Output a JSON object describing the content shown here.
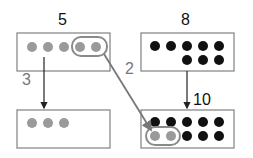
{
  "diagram": {
    "boxes": [
      {
        "id": "top-left",
        "label": "5",
        "gray_dots": 5,
        "black_dots": 0
      },
      {
        "id": "top-right",
        "label": "8",
        "gray_dots": 0,
        "black_dots": 8
      },
      {
        "id": "bottom-left",
        "label": "",
        "gray_dots": 3,
        "black_dots": 0
      },
      {
        "id": "bottom-right",
        "label": "10",
        "gray_dots": 2,
        "black_dots": 8
      }
    ],
    "arrows": [
      {
        "from": "top-left",
        "to": "bottom-left",
        "label": "3"
      },
      {
        "from": "top-left",
        "to": "bottom-right",
        "label": "2"
      },
      {
        "from": "top-right",
        "to": "bottom-right",
        "label": ""
      }
    ],
    "labels": {
      "top_left": "5",
      "top_right": "8",
      "bottom_right": "10",
      "arrow_left": "3",
      "arrow_diag": "2"
    },
    "colors": {
      "gray_dot": "#9a9a9a",
      "black_dot": "#111111",
      "box_border": "#8a8a8a",
      "highlight": "#8a8a8a"
    }
  }
}
